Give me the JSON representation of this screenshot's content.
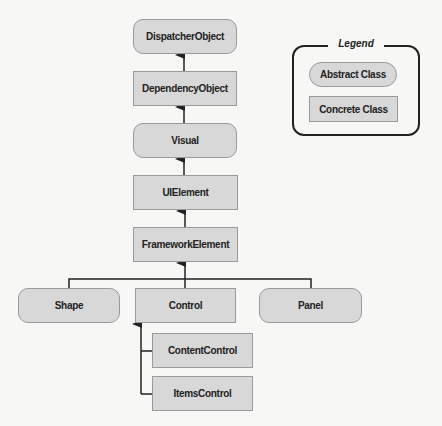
{
  "diagram": {
    "type": "class-hierarchy",
    "nodes": {
      "dispatcher_object": {
        "label": "DispatcherObject",
        "kind": "abstract"
      },
      "dependency_object": {
        "label": "DependencyObject",
        "kind": "concrete"
      },
      "visual": {
        "label": "Visual",
        "kind": "abstract"
      },
      "ui_element": {
        "label": "UIElement",
        "kind": "concrete"
      },
      "framework_element": {
        "label": "FrameworkElement",
        "kind": "concrete"
      },
      "shape": {
        "label": "Shape",
        "kind": "abstract"
      },
      "control": {
        "label": "Control",
        "kind": "concrete"
      },
      "panel": {
        "label": "Panel",
        "kind": "abstract"
      },
      "content_control": {
        "label": "ContentControl",
        "kind": "concrete"
      },
      "items_control": {
        "label": "ItemsControl",
        "kind": "concrete"
      }
    },
    "edges": [
      {
        "from": "DependencyObject",
        "to": "DispatcherObject"
      },
      {
        "from": "Visual",
        "to": "DependencyObject"
      },
      {
        "from": "UIElement",
        "to": "Visual"
      },
      {
        "from": "FrameworkElement",
        "to": "UIElement"
      },
      {
        "from": "Shape",
        "to": "FrameworkElement"
      },
      {
        "from": "Control",
        "to": "FrameworkElement"
      },
      {
        "from": "Panel",
        "to": "FrameworkElement"
      },
      {
        "from": "ContentControl",
        "to": "Control"
      },
      {
        "from": "ItemsControl",
        "to": "Control"
      }
    ]
  },
  "legend": {
    "title": "Legend",
    "abstract_label": "Abstract Class",
    "concrete_label": "Concrete Class"
  },
  "colors": {
    "node_fill": "#d8d8d8",
    "node_border": "#9a9a9a",
    "line": "#222222"
  }
}
